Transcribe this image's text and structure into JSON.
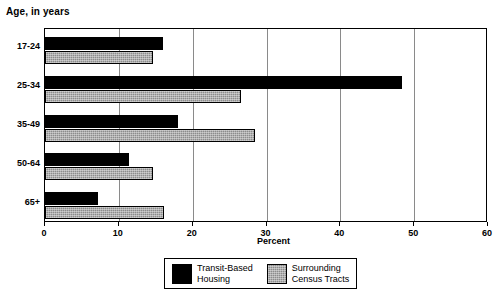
{
  "chart_data": {
    "type": "bar",
    "orientation": "horizontal",
    "title": "Age, in years",
    "xlabel": "Percent",
    "ylabel": "",
    "categories": [
      "17-24",
      "25-34",
      "35-49",
      "50-64",
      "65+"
    ],
    "series": [
      {
        "name": "Transit-Based\nHousing",
        "legend_label_line1": "Transit-Based",
        "legend_label_line2": "Housing",
        "color": "#000000",
        "values": [
          16.0,
          48.4,
          18.0,
          11.4,
          7.2
        ]
      },
      {
        "name": "Surrounding\nCensus Tracts",
        "legend_label_line1": "Surrounding",
        "legend_label_line2": "Census Tracts",
        "color": "#8c8c8c",
        "values": [
          14.6,
          26.6,
          28.4,
          14.6,
          16.1
        ]
      }
    ],
    "xlim": [
      0,
      60
    ],
    "xticks": [
      0,
      10,
      20,
      30,
      40,
      50,
      60
    ],
    "xtick_labels": [
      "0",
      "10",
      "20",
      "30",
      "40",
      "50",
      "60"
    ],
    "grid": true,
    "grid_axis": "x",
    "legend_position": "bottom-center"
  }
}
